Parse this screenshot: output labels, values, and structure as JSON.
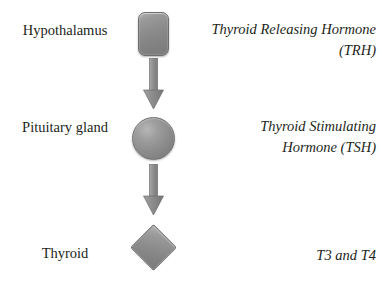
{
  "diagram": {
    "background_color": "#ffffff",
    "text_color": "#231f20",
    "shape_fill_color": "#8c8c8c",
    "shape_border_color": "#6e6e6e",
    "arrow_color": "#8a8a8a"
  },
  "organs": [
    {
      "label": "Hypothalamus",
      "shape": "rounded-rectangle"
    },
    {
      "label": "Pituitary gland",
      "shape": "circle"
    },
    {
      "label": "Thyroid",
      "shape": "diamond"
    }
  ],
  "hormones": [
    {
      "line1": "Thyroid Releasing Hormone",
      "line2": "(TRH)"
    },
    {
      "line1": "Thyroid Stimulating",
      "line2": "Hormone (TSH)"
    },
    {
      "line1": "T3 and T4",
      "line2": ""
    }
  ],
  "arrows": [
    {
      "from": "Hypothalamus",
      "to": "Pituitary gland",
      "direction": "down"
    },
    {
      "from": "Pituitary gland",
      "to": "Thyroid",
      "direction": "down"
    }
  ]
}
